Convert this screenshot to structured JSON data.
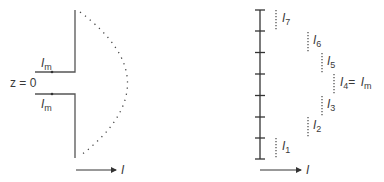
{
  "left_diagram": {
    "title": "Dipole antenna feed current distribution",
    "feed_label_top": {
      "symbol": "I",
      "subscript": "m"
    },
    "feed_label_bottom": {
      "symbol": "I",
      "subscript": "m"
    },
    "origin_label": "z = 0",
    "axis_label": "I",
    "line_color": "#555555"
  },
  "right_diagram": {
    "title": "Discretized segment currents",
    "segments": [
      {
        "symbol": "I",
        "subscript": "7",
        "suffix": ""
      },
      {
        "symbol": "I",
        "subscript": "6",
        "suffix": ""
      },
      {
        "symbol": "I",
        "subscript": "5",
        "suffix": ""
      },
      {
        "symbol": "I",
        "subscript": "4",
        "suffix": "= ",
        "suffix_symbol": "I",
        "suffix_subscript": "m"
      },
      {
        "symbol": "I",
        "subscript": "3",
        "suffix": ""
      },
      {
        "symbol": "I",
        "subscript": "2",
        "suffix": ""
      },
      {
        "symbol": "I",
        "subscript": "1",
        "suffix": ""
      }
    ],
    "tick_count": 8,
    "axis_label": "I"
  }
}
